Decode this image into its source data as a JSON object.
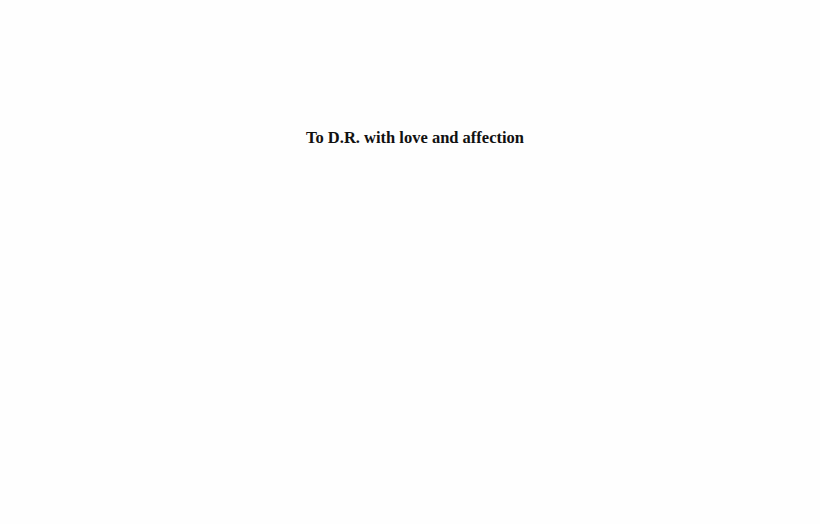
{
  "page": {
    "dedication": "To D.R. with love and affection"
  }
}
